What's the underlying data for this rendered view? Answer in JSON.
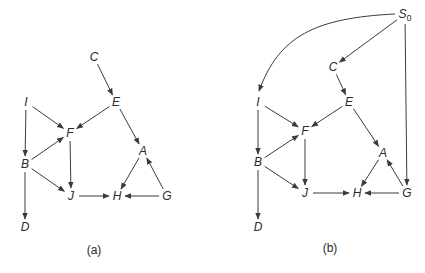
{
  "colors": {
    "ink": "#2a2a2a",
    "edge": "#3a3a3a",
    "background": "#ffffff"
  },
  "graphs": [
    {
      "id": "a",
      "caption": "(a)",
      "caption_pos": [
        94,
        254
      ],
      "nodes": [
        {
          "id": "C",
          "label": "C",
          "x": 94,
          "y": 57
        },
        {
          "id": "E",
          "label": "E",
          "x": 116,
          "y": 102
        },
        {
          "id": "I",
          "label": "I",
          "x": 26,
          "y": 102
        },
        {
          "id": "F",
          "label": "F",
          "x": 70,
          "y": 133
        },
        {
          "id": "A",
          "label": "A",
          "x": 143,
          "y": 151
        },
        {
          "id": "B",
          "label": "B",
          "x": 25,
          "y": 164
        },
        {
          "id": "J",
          "label": "J",
          "x": 71,
          "y": 196
        },
        {
          "id": "H",
          "label": "H",
          "x": 117,
          "y": 196
        },
        {
          "id": "G",
          "label": "G",
          "x": 167,
          "y": 196
        },
        {
          "id": "D",
          "label": "D",
          "x": 25,
          "y": 227
        }
      ],
      "edges": [
        {
          "from": "C",
          "to": "E"
        },
        {
          "from": "E",
          "to": "F"
        },
        {
          "from": "E",
          "to": "A"
        },
        {
          "from": "I",
          "to": "F"
        },
        {
          "from": "I",
          "to": "B"
        },
        {
          "from": "B",
          "to": "F"
        },
        {
          "from": "B",
          "to": "J"
        },
        {
          "from": "B",
          "to": "D"
        },
        {
          "from": "F",
          "to": "J"
        },
        {
          "from": "J",
          "to": "H"
        },
        {
          "from": "A",
          "to": "H"
        },
        {
          "from": "G",
          "to": "H"
        },
        {
          "from": "G",
          "to": "A"
        }
      ]
    },
    {
      "id": "b",
      "caption": "(b)",
      "caption_pos": [
        330,
        252
      ],
      "nodes": [
        {
          "id": "S0",
          "label": "S",
          "subscript": "0",
          "x": 405,
          "y": 14
        },
        {
          "id": "C",
          "label": "C",
          "x": 333,
          "y": 67
        },
        {
          "id": "E",
          "label": "E",
          "x": 349,
          "y": 102
        },
        {
          "id": "I",
          "label": "I",
          "x": 258,
          "y": 102
        },
        {
          "id": "F",
          "label": "F",
          "x": 305,
          "y": 131
        },
        {
          "id": "A",
          "label": "A",
          "x": 383,
          "y": 153
        },
        {
          "id": "B",
          "label": "B",
          "x": 258,
          "y": 162
        },
        {
          "id": "J",
          "label": "J",
          "x": 305,
          "y": 193
        },
        {
          "id": "H",
          "label": "H",
          "x": 357,
          "y": 193
        },
        {
          "id": "G",
          "label": "G",
          "x": 407,
          "y": 193
        },
        {
          "id": "D",
          "label": "D",
          "x": 258,
          "y": 227
        }
      ],
      "edges": [
        {
          "from": "S0",
          "to": "I",
          "curved": true
        },
        {
          "from": "S0",
          "to": "C"
        },
        {
          "from": "S0",
          "to": "G"
        },
        {
          "from": "C",
          "to": "E"
        },
        {
          "from": "E",
          "to": "F"
        },
        {
          "from": "E",
          "to": "A"
        },
        {
          "from": "I",
          "to": "F"
        },
        {
          "from": "I",
          "to": "B"
        },
        {
          "from": "B",
          "to": "F"
        },
        {
          "from": "B",
          "to": "J"
        },
        {
          "from": "B",
          "to": "D"
        },
        {
          "from": "F",
          "to": "J"
        },
        {
          "from": "J",
          "to": "H"
        },
        {
          "from": "A",
          "to": "H"
        },
        {
          "from": "G",
          "to": "H"
        },
        {
          "from": "G",
          "to": "A"
        }
      ]
    }
  ]
}
